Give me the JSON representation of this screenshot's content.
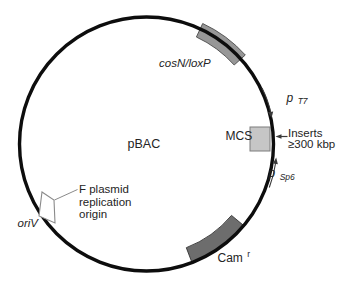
{
  "figure": {
    "kind": "plasmid-map",
    "plasmid_name": "pBAC"
  },
  "labels": {
    "plasmid_name": "pBAC",
    "cosn_loxp": "cosN/loxP",
    "mcs": "MCS",
    "cam_main": "Cam",
    "cam_sup": "r",
    "oriv": "oriV",
    "t7_main": "p",
    "t7_sub": "T7",
    "sp6_main": "p",
    "sp6_sub": "Sp6",
    "inserts_line1": "Inserts",
    "inserts_line2": "≥300 kbp",
    "f_plasmid_line1": "F plasmid",
    "f_plasmid_line2": "replication",
    "f_plasmid_line3": "origin"
  },
  "features": [
    {
      "label": "cosN/loxP"
    },
    {
      "label": "MCS",
      "promoters": [
        "pT7",
        "pSp6"
      ],
      "insert_note": "Inserts ≥300 kbp"
    },
    {
      "label": "Camr"
    },
    {
      "label": "oriV",
      "annotation": "F plasmid replication origin"
    }
  ],
  "colors": {
    "background": "#ffffff",
    "circle_stroke": "#0d0d0d",
    "cosn_fill": "#979797",
    "cosn_stroke": "#4a4a4a",
    "cam_fill": "#6d6d6d",
    "cam_stroke": "#333333",
    "mcs_fill": "#c6c6c6",
    "mcs_stroke": "#7d7d7d",
    "oriv_fill": "#ffffff",
    "oriv_stroke": "#8a8a8a",
    "arrow": "#3a3a3a",
    "leader": "#8a8a8a",
    "text": "#242424"
  }
}
